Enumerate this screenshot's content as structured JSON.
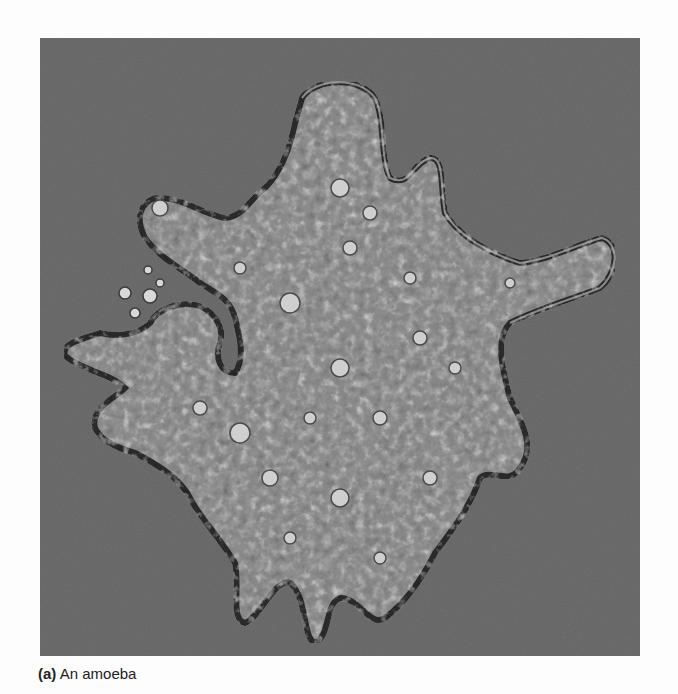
{
  "figure": {
    "caption_label": "(a)",
    "caption_text": "An amoeba",
    "subject": "amoeba",
    "image_type": "phase-contrast micrograph",
    "colors": {
      "page_background": "#fdfdfd",
      "photo_background": "#6e6e6e",
      "cell_body": "#8f8f8f",
      "cell_edge_dark": "#2e2e2e",
      "vacuole_highlight": "#d8d8d8",
      "caption_text": "#222222"
    }
  }
}
